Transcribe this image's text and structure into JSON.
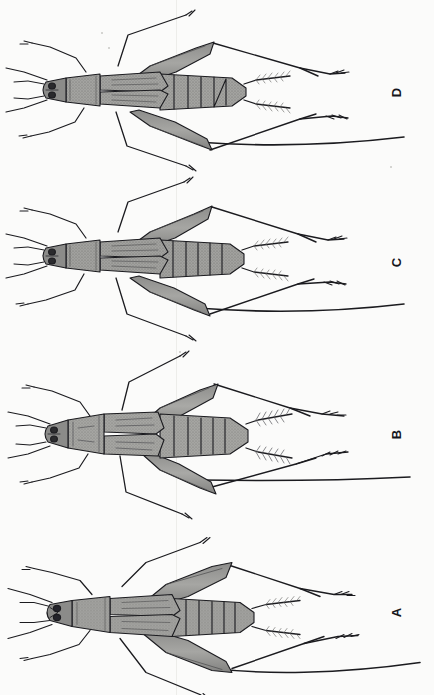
{
  "plate": {
    "title": "Cricket specimen plate",
    "background_color": "#fbfbfa",
    "ink_color": "#15151a",
    "body_fill_color": "#9a9a98",
    "body_fill_light": "#b9b9b6",
    "body_fill_dark": "#6f6f6d",
    "width": 434,
    "height": 695,
    "orientation_note": "Specimens rotated 90 degrees; head at left, abdomen at right.",
    "panel_count": 4
  },
  "panels": [
    {
      "id": "panel-d",
      "label": "D",
      "order_from_top": 1,
      "wing_form": "macropterous",
      "label_x": 388,
      "label_y": 86,
      "top": 0
    },
    {
      "id": "panel-c",
      "label": "C",
      "order_from_top": 2,
      "wing_form": "macropterous",
      "label_x": 388,
      "label_y": 256,
      "top": 172
    },
    {
      "id": "panel-b",
      "label": "B",
      "order_from_top": 3,
      "wing_form": "brachypterous",
      "label_x": 388,
      "label_y": 428,
      "top": 344
    },
    {
      "id": "panel-a",
      "label": "A",
      "order_from_top": 4,
      "wing_form": "macropterous",
      "label_x": 388,
      "label_y": 606,
      "top": 520
    }
  ],
  "anatomy_labels": {
    "head": "head",
    "antenna": "antenna",
    "maxillary_palp": "maxillary-palp",
    "pronotum": "pronotum",
    "tegmen": "tegmen-forewing",
    "abdomen": "abdomen",
    "cercus": "cercus",
    "fore_leg": "fore-leg",
    "mid_leg": "mid-leg",
    "hind_femur": "hind-femur",
    "hind_tibia": "hind-tibia",
    "tarsus": "tarsus"
  }
}
